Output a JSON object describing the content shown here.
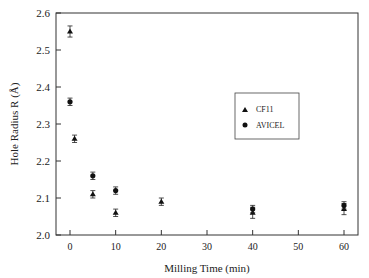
{
  "chart_data": {
    "type": "scatter",
    "title": "",
    "xlabel": "Milling Time (min)",
    "ylabel": "Hole Radius R (Å)",
    "xlim": [
      -3,
      65
    ],
    "ylim": [
      2.0,
      2.6
    ],
    "xticks": [
      0,
      10,
      20,
      30,
      40,
      50,
      60
    ],
    "yticks": [
      2.0,
      2.1,
      2.2,
      2.3,
      2.4,
      2.5,
      2.6
    ],
    "grid": false,
    "legend_position": "upper right (inside)",
    "series": [
      {
        "name": "CF11",
        "marker": "triangle",
        "x": [
          0,
          1,
          5,
          10,
          20,
          40,
          60
        ],
        "y": [
          2.55,
          2.26,
          2.11,
          2.06,
          2.09,
          2.06,
          2.07
        ],
        "error": [
          0.015,
          0.01,
          0.01,
          0.01,
          0.01,
          0.015,
          0.015
        ]
      },
      {
        "name": "AVICEL",
        "marker": "circle",
        "x": [
          0,
          5,
          10,
          40,
          60
        ],
        "y": [
          2.36,
          2.16,
          2.12,
          2.07,
          2.08
        ],
        "error": [
          0.01,
          0.01,
          0.01,
          0.01,
          0.01
        ]
      }
    ]
  }
}
